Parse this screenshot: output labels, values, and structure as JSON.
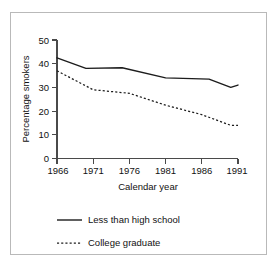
{
  "figure": {
    "background_color": "#ffffff",
    "frame_color": "#b9b9b9",
    "axis_color": "#4a4a4a",
    "ink_color": "#1c1c1c"
  },
  "chart_data": {
    "type": "line",
    "title": "",
    "subtitle": "",
    "xlabel": "Calendar year",
    "ylabel": "Percentage smokers",
    "xlim": [
      1966,
      1991
    ],
    "ylim": [
      0,
      50
    ],
    "xticks": [
      1966,
      1971,
      1976,
      1981,
      1986,
      1991
    ],
    "yticks": [
      0,
      10,
      20,
      30,
      40,
      50
    ],
    "xtick_labels": [
      "1966",
      "1971",
      "1976",
      "1981",
      "1986",
      "1991"
    ],
    "ytick_labels": [
      "0",
      "10",
      "20",
      "30",
      "40",
      "50"
    ],
    "grid": false,
    "legend_position": "below",
    "series": [
      {
        "name": "Less than high school",
        "style": "solid",
        "color": "#1c1c1c",
        "x": [
          1966,
          1970,
          1975,
          1981,
          1987,
          1990,
          1991
        ],
        "values": [
          42.5,
          38.0,
          38.3,
          34.0,
          33.5,
          30.0,
          31.0
        ]
      },
      {
        "name": "College graduate",
        "style": "dashed",
        "color": "#1c1c1c",
        "x": [
          1966,
          1971,
          1976,
          1981,
          1986,
          1990,
          1991
        ],
        "values": [
          37.0,
          29.0,
          27.5,
          22.5,
          18.5,
          14.0,
          14.0
        ]
      }
    ]
  },
  "legend": {
    "items": [
      {
        "label": "Less than high school",
        "style": "solid"
      },
      {
        "label": "College graduate",
        "style": "dashed"
      }
    ]
  }
}
